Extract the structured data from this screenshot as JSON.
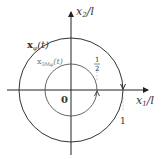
{
  "diagram": {
    "axes": {
      "x_label_main": "x",
      "x_label_sub": "1",
      "x_label_suffix": "/l",
      "y_label_main": "x",
      "y_label_sub": "2",
      "y_label_suffix": "/l",
      "origin_label": "0"
    },
    "curves": [
      {
        "name": "outer-circle",
        "label_main": "x",
        "label_sub": "φ",
        "label_suffix": "(t)",
        "radius_label": "1",
        "direction": "clockwise"
      },
      {
        "name": "inner-circle",
        "label_main": "x",
        "label_sub": "3Mφ",
        "label_suffix": "(t)",
        "radius_label_num": "1",
        "radius_label_den": "2",
        "direction": "counterclockwise"
      }
    ],
    "colors": {
      "axis": "#222222",
      "outer_circle": "#333333",
      "inner_circle": "#555555",
      "text": "#333333"
    }
  }
}
